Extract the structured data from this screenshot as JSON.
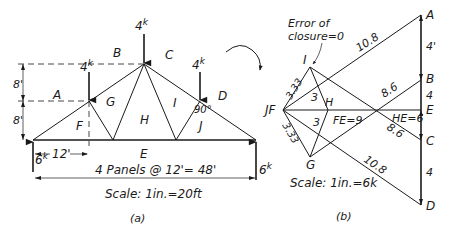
{
  "truss": {
    "loads": [
      {
        "id": "load-left",
        "label": "4",
        "unit": "k"
      },
      {
        "id": "load-apex",
        "label": "4",
        "unit": "k"
      },
      {
        "id": "load-right",
        "label": "4",
        "unit": "k"
      }
    ],
    "reactions": [
      {
        "id": "reaction-left",
        "label": "6",
        "unit": "k"
      },
      {
        "id": "reaction-right",
        "label": "6",
        "unit": "k"
      }
    ],
    "spaces": {
      "A": "A",
      "B": "B",
      "C": "C",
      "D": "D",
      "E": "E",
      "F": "F",
      "G": "G",
      "H": "H",
      "I": "I",
      "J": "J"
    },
    "dimensions": {
      "height_upper": "8'",
      "height_lower": "8'",
      "panel_width": "12'",
      "span": "4 Panels @ 12'= 48'",
      "angle": "90°"
    },
    "scale": "Scale: 1in.=20ft",
    "caption": "(a)"
  },
  "polygon": {
    "annotation": "Error of closure=0",
    "annotation_line1": "Error of",
    "annotation_line2": "closure=0",
    "points": {
      "A": "A",
      "B": "B",
      "C": "C",
      "D": "D",
      "E": "E",
      "JF": "JF",
      "I": "I",
      "H": "H",
      "G": "G"
    },
    "forces": {
      "AI_upper": "10.8",
      "AB": "4'",
      "BE": "4",
      "CD": "4",
      "BH": "8.6",
      "HC": "8.6",
      "FE": "FE=9",
      "HE": "HE=6",
      "GD": "10.8",
      "JF_I": "3.33",
      "JF_G": "3.33",
      "IH": "3",
      "HG": "3"
    },
    "scale": "Scale: 1in.=6k",
    "caption": "(b)"
  }
}
